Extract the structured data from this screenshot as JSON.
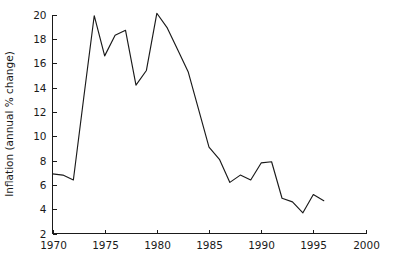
{
  "chart_data": {
    "type": "line",
    "title": "",
    "subtitle": "",
    "xlabel": "",
    "ylabel": "Inflation (annual % change)",
    "xlim": [
      1970,
      2000
    ],
    "ylim": [
      2,
      20
    ],
    "grid": false,
    "legend": false,
    "legend_position": "none",
    "x_ticks": [
      "1970",
      "1975",
      "1980",
      "1985",
      "1990",
      "1995",
      "2000"
    ],
    "x_tick_values": [
      1970,
      1975,
      1980,
      1985,
      1990,
      1995,
      2000
    ],
    "y_ticks": [
      "2",
      "4",
      "6",
      "8",
      "10",
      "12",
      "14",
      "16",
      "18",
      "20"
    ],
    "y_tick_values": [
      2,
      4,
      6,
      8,
      10,
      12,
      14,
      16,
      18,
      20
    ],
    "x": [
      1970,
      1971,
      1972,
      1973,
      1974,
      1975,
      1976,
      1977,
      1978,
      1979,
      1980,
      1981,
      1982,
      1983,
      1984,
      1985,
      1986,
      1987,
      1988,
      1989,
      1990,
      1991,
      1992,
      1993,
      1994,
      1995,
      1996
    ],
    "values": [
      6.9,
      6.8,
      6.4,
      13.2,
      19.9,
      16.6,
      18.3,
      18.7,
      14.2,
      15.4,
      20.1,
      18.9,
      17.1,
      15.3,
      12.2,
      9.1,
      8.1,
      6.2,
      6.8,
      6.4,
      7.8,
      7.9,
      4.9,
      4.6,
      3.7,
      5.2,
      4.7
    ],
    "series": [
      {
        "name": "Inflation (annual % change)",
        "color": "#1a1a1a",
        "values": [
          6.9,
          6.8,
          6.4,
          13.2,
          19.9,
          16.6,
          18.3,
          18.7,
          14.2,
          15.4,
          20.1,
          18.9,
          17.1,
          15.3,
          12.2,
          9.1,
          8.1,
          6.2,
          6.8,
          6.4,
          7.8,
          7.9,
          4.9,
          4.6,
          3.7,
          5.2,
          4.7
        ]
      }
    ],
    "annotations": []
  },
  "colors": {
    "line": "#1a1a1a",
    "axis": "#1a1a1a",
    "background": "#ffffff",
    "text": "#1a1a1a"
  }
}
